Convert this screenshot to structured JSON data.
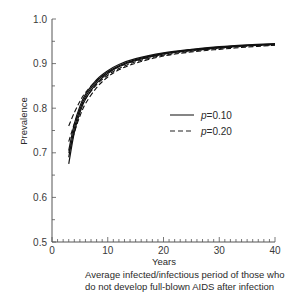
{
  "chart_data": {
    "type": "line",
    "title": "",
    "xlabel": "Years",
    "ylabel": "Prevalence",
    "xlim": [
      0,
      40
    ],
    "ylim": [
      0.5,
      1.0
    ],
    "x_ticks": [
      "0",
      "10",
      "20",
      "30",
      "40"
    ],
    "y_ticks": [
      "0.5",
      "0.6",
      "0.7",
      "0.8",
      "0.9",
      "1.0"
    ],
    "x_minor_tick_step": 1,
    "y_minor_tick_step": 0.05,
    "grid": false,
    "legend_position": "center-right",
    "legend": [
      {
        "label": "p=0.10",
        "style": "solid"
      },
      {
        "label": "p=0.20",
        "style": "dashed"
      }
    ],
    "x": [
      3,
      4,
      5,
      6,
      8,
      10,
      12,
      15,
      20,
      25,
      30,
      35,
      40
    ],
    "series": [
      {
        "name": "p=0.10 (a)",
        "style": "solid",
        "values": [
          0.675,
          0.745,
          0.79,
          0.82,
          0.856,
          0.878,
          0.893,
          0.907,
          0.922,
          0.93,
          0.936,
          0.94,
          0.943
        ]
      },
      {
        "name": "p=0.10 (b)",
        "style": "solid",
        "values": [
          0.69,
          0.755,
          0.797,
          0.826,
          0.86,
          0.881,
          0.895,
          0.909,
          0.923,
          0.931,
          0.937,
          0.941,
          0.944
        ]
      },
      {
        "name": "p=0.10 (c)",
        "style": "solid",
        "values": [
          0.705,
          0.765,
          0.804,
          0.831,
          0.864,
          0.884,
          0.898,
          0.911,
          0.924,
          0.932,
          0.938,
          0.942,
          0.945
        ]
      },
      {
        "name": "p=0.20 (a)",
        "style": "dashed",
        "values": [
          0.7,
          0.745,
          0.782,
          0.81,
          0.846,
          0.87,
          0.886,
          0.901,
          0.917,
          0.926,
          0.932,
          0.937,
          0.941
        ]
      },
      {
        "name": "p=0.20 (b)",
        "style": "dashed",
        "values": [
          0.725,
          0.765,
          0.796,
          0.821,
          0.853,
          0.874,
          0.889,
          0.904,
          0.919,
          0.928,
          0.934,
          0.939,
          0.942
        ]
      },
      {
        "name": "p=0.20 (c)",
        "style": "dashed",
        "values": [
          0.76,
          0.79,
          0.815,
          0.835,
          0.862,
          0.88,
          0.893,
          0.907,
          0.921,
          0.929,
          0.935,
          0.94,
          0.943
        ]
      }
    ],
    "caption_lines": [
      "Average infected/infectious period of those who",
      "do not develop full-blown AIDS after infection"
    ]
  }
}
